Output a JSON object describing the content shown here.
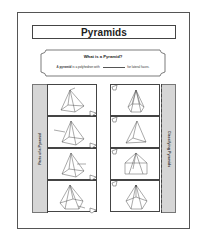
{
  "title": "Pyramids",
  "definition": {
    "heading": "What is a Pyramid?",
    "text_prefix": "A ",
    "term": "pyramid",
    "text_middle": " is a polyhedron with ",
    "text_suffix": " for lateral faces."
  },
  "left_strip": {
    "label": "Parts of a Pyramid"
  },
  "right_strip": {
    "label": "Classifying Pyramids"
  },
  "left_cards": [
    {
      "shape": "square-pyramid-apex-label"
    },
    {
      "shape": "square-pyramid-edge-label"
    },
    {
      "shape": "square-pyramid-face-label"
    },
    {
      "shape": "pentagonal-pyramid-base-label"
    }
  ],
  "right_cards": [
    {
      "shape": "hexagonal-pyramid"
    },
    {
      "shape": "triangular-pyramid"
    },
    {
      "shape": "rectangular-pyramid"
    },
    {
      "shape": "pentagonal-pyramid"
    }
  ],
  "colors": {
    "border": "#444444",
    "strip_fill": "#d6d6d6",
    "background": "#ffffff"
  }
}
